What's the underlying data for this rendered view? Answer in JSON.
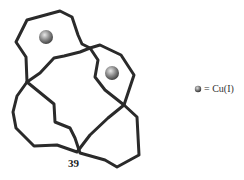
{
  "figure": {
    "type": "knotted-molecular-topology",
    "compound_number": "39",
    "strand_color": "#2a2a2a",
    "metal_ion_color": "#777777",
    "metal_ions": [
      {
        "cx": 46,
        "cy": 37,
        "r": 7
      },
      {
        "cx": 112,
        "cy": 73,
        "r": 7
      }
    ]
  },
  "legend": {
    "symbol": "sphere",
    "text": "= Cu(I)"
  }
}
